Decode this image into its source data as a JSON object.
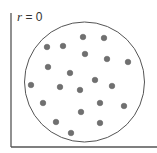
{
  "label": {
    "var": "r",
    "eq": " = 0"
  },
  "colors": {
    "axis": "#555555",
    "circle": "#555555",
    "dot": "#707070",
    "dot_edge": "#5a5a5a"
  },
  "circle": {
    "cx": 84.5,
    "cy": 82,
    "r": 60
  },
  "axes": {
    "x0": 11,
    "y_top": 13,
    "y_bottom": 147,
    "x_right": 157
  },
  "chart_data": {
    "type": "scatter",
    "title": "r = 0",
    "points": [
      [
        83,
        37
      ],
      [
        104,
        38
      ],
      [
        47,
        47
      ],
      [
        63,
        46
      ],
      [
        85,
        54
      ],
      [
        107,
        59
      ],
      [
        128,
        62
      ],
      [
        48,
        67
      ],
      [
        70,
        73
      ],
      [
        95,
        80
      ],
      [
        31,
        85
      ],
      [
        60,
        87
      ],
      [
        80,
        90
      ],
      [
        112,
        86
      ],
      [
        43,
        103
      ],
      [
        100,
        103
      ],
      [
        124,
        106
      ],
      [
        81,
        112
      ],
      [
        56,
        122
      ],
      [
        100,
        123
      ],
      [
        71,
        133
      ]
    ]
  }
}
